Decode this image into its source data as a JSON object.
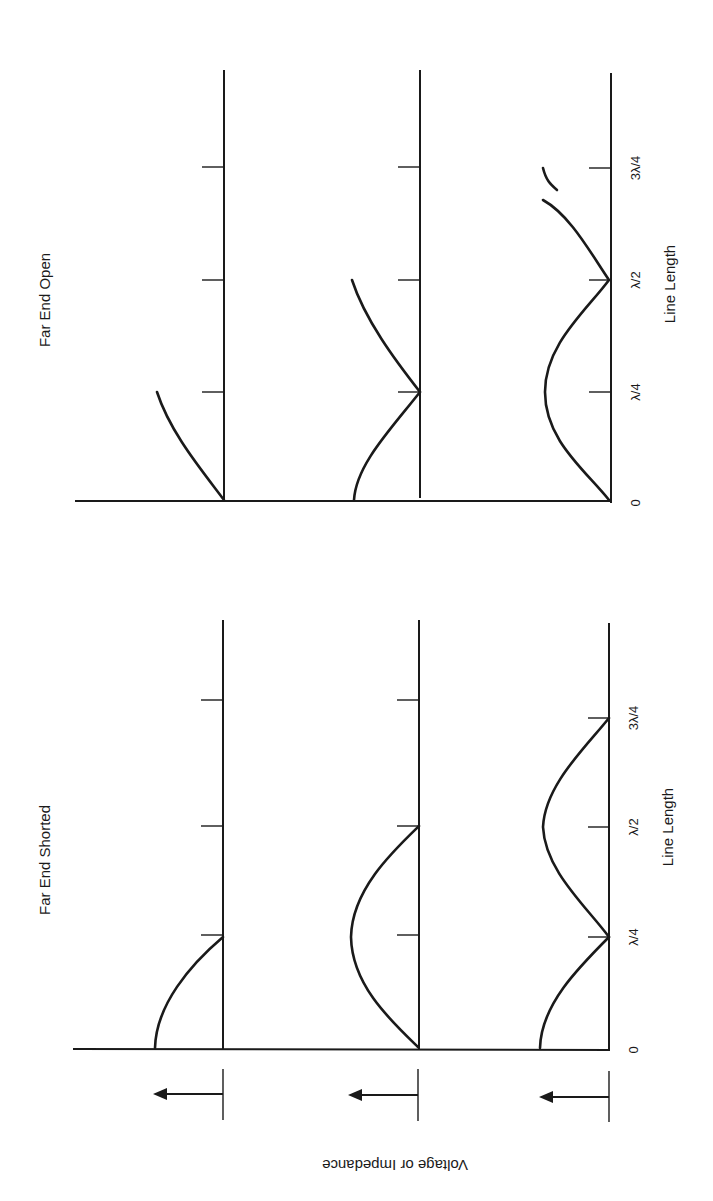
{
  "diagram": {
    "panels": [
      {
        "title": "Far End Open",
        "curves": [
          "voltage/impedance trace 1",
          "voltage/impedance trace 2",
          "voltage/impedance trace 3"
        ]
      },
      {
        "title": "Far End Shorted",
        "curves": [
          "voltage/impedance trace 1",
          "voltage/impedance trace 2",
          "voltage/impedance trace 3"
        ]
      }
    ],
    "x_axis": {
      "label": "Line Length",
      "ticks": [
        "0",
        "λ/4",
        "λ/2",
        "3λ/4"
      ]
    },
    "y_axis": {
      "label": "Voltage or Impedance"
    },
    "colors": {
      "ink": "#1a1a1a",
      "background": "#ffffff"
    }
  }
}
